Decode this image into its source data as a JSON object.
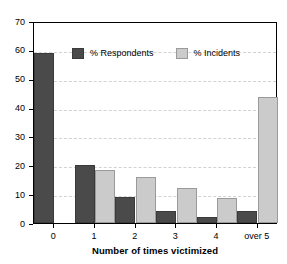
{
  "chart_data": {
    "type": "bar",
    "title": "",
    "xlabel": "Number of times victimized",
    "ylabel": "",
    "categories": [
      "0",
      "1",
      "2",
      "3",
      "4",
      "over 5"
    ],
    "series": [
      {
        "name": "% Respondents",
        "color": "#4a4a4a",
        "values": [
          59,
          20,
          9,
          4,
          2,
          4
        ]
      },
      {
        "name": "% Incidents",
        "color": "#cbcbcb",
        "values": [
          null,
          18.5,
          16,
          12,
          8.5,
          43.5
        ]
      }
    ],
    "ylim": [
      0,
      70
    ],
    "ytick_step": 10,
    "yticks": [
      "0",
      "10",
      "20",
      "30",
      "40",
      "50",
      "60",
      "70"
    ],
    "grid": true,
    "legend_position": "top-left-inside"
  },
  "legend": {
    "items": [
      {
        "label": "% Respondents",
        "swatch": "dark"
      },
      {
        "label": "% Incidents",
        "swatch": "light"
      }
    ]
  },
  "axes": {
    "x_title": "Number of times victimized"
  }
}
